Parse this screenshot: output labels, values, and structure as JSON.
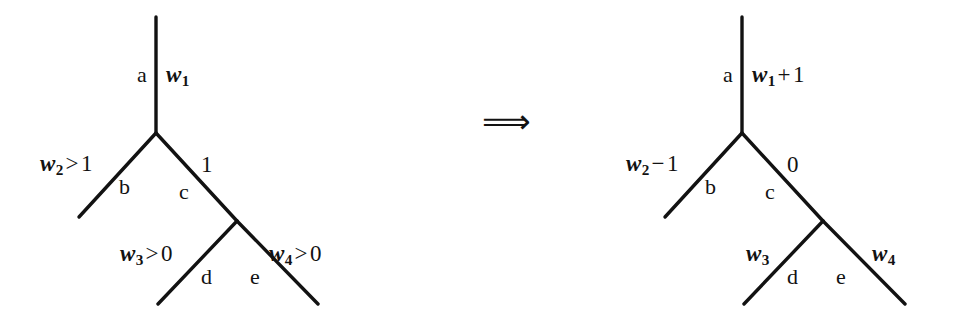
{
  "figure": {
    "type": "tree-rewrite-diagram",
    "background_color": "#ffffff",
    "ink_color": "#121212",
    "relation_symbol": "⟹",
    "relation_name": "double-right-arrow"
  },
  "left_tree": {
    "name": "before-tree",
    "root_edge": {
      "node_label": "a",
      "weight_label": "w",
      "weight_sub": "1",
      "weight_text": "w₁"
    },
    "edges": [
      {
        "id": "a",
        "node_label": "a",
        "weight": "w₁",
        "weight_var": "w",
        "weight_sub": "1",
        "weight_op": "",
        "weight_rhs": ""
      },
      {
        "id": "b",
        "node_label": "b",
        "weight": "w₂ > 1",
        "weight_var": "w",
        "weight_sub": "2",
        "weight_op": ">",
        "weight_rhs": "1"
      },
      {
        "id": "c",
        "node_label": "c",
        "weight": "1",
        "weight_var": "",
        "weight_sub": "",
        "weight_op": "",
        "weight_rhs": "1"
      },
      {
        "id": "d",
        "node_label": "d",
        "weight": "w₃ > 0",
        "weight_var": "w",
        "weight_sub": "3",
        "weight_op": ">",
        "weight_rhs": "0"
      },
      {
        "id": "e",
        "node_label": "e",
        "weight": "w₄ > 0",
        "weight_var": "w",
        "weight_sub": "4",
        "weight_op": ">",
        "weight_rhs": "0"
      }
    ]
  },
  "right_tree": {
    "name": "after-tree",
    "edges": [
      {
        "id": "a",
        "node_label": "a",
        "weight": "w₁ + 1",
        "weight_var": "w",
        "weight_sub": "1",
        "weight_op": "+",
        "weight_rhs": "1"
      },
      {
        "id": "b",
        "node_label": "b",
        "weight": "w₂ − 1",
        "weight_var": "w",
        "weight_sub": "2",
        "weight_op": "−",
        "weight_rhs": "1"
      },
      {
        "id": "c",
        "node_label": "c",
        "weight": "0",
        "weight_var": "",
        "weight_sub": "",
        "weight_op": "",
        "weight_rhs": "0"
      },
      {
        "id": "d",
        "node_label": "d",
        "weight": "w₃",
        "weight_var": "w",
        "weight_sub": "3",
        "weight_op": "",
        "weight_rhs": ""
      },
      {
        "id": "e",
        "node_label": "e",
        "weight": "w₄",
        "weight_var": "w",
        "weight_sub": "4",
        "weight_op": "",
        "weight_rhs": ""
      }
    ]
  },
  "labels": {
    "l_a_node": "a",
    "l_a_weight_var": "w",
    "l_a_weight_sub": "1",
    "l_b_node": "b",
    "l_b_weight_var": "w",
    "l_b_weight_sub": "2",
    "l_b_weight_op": ">",
    "l_b_weight_rhs": "1",
    "l_c_node": "c",
    "l_c_weight": "1",
    "l_d_node": "d",
    "l_d_weight_var": "w",
    "l_d_weight_sub": "3",
    "l_d_weight_op": ">",
    "l_d_weight_rhs": "0",
    "l_e_node": "e",
    "l_e_weight_var": "w",
    "l_e_weight_sub": "4",
    "l_e_weight_op": ">",
    "l_e_weight_rhs": "0",
    "r_a_node": "a",
    "r_a_weight_var": "w",
    "r_a_weight_sub": "1",
    "r_a_weight_op": "+",
    "r_a_weight_rhs": "1",
    "r_b_node": "b",
    "r_b_weight_var": "w",
    "r_b_weight_sub": "2",
    "r_b_weight_op": "−",
    "r_b_weight_rhs": "1",
    "r_c_node": "c",
    "r_c_weight": "0",
    "r_d_node": "d",
    "r_d_weight_var": "w",
    "r_d_weight_sub": "3",
    "r_e_node": "e",
    "r_e_weight_var": "w",
    "r_e_weight_sub": "4",
    "arrow": "⟹"
  }
}
